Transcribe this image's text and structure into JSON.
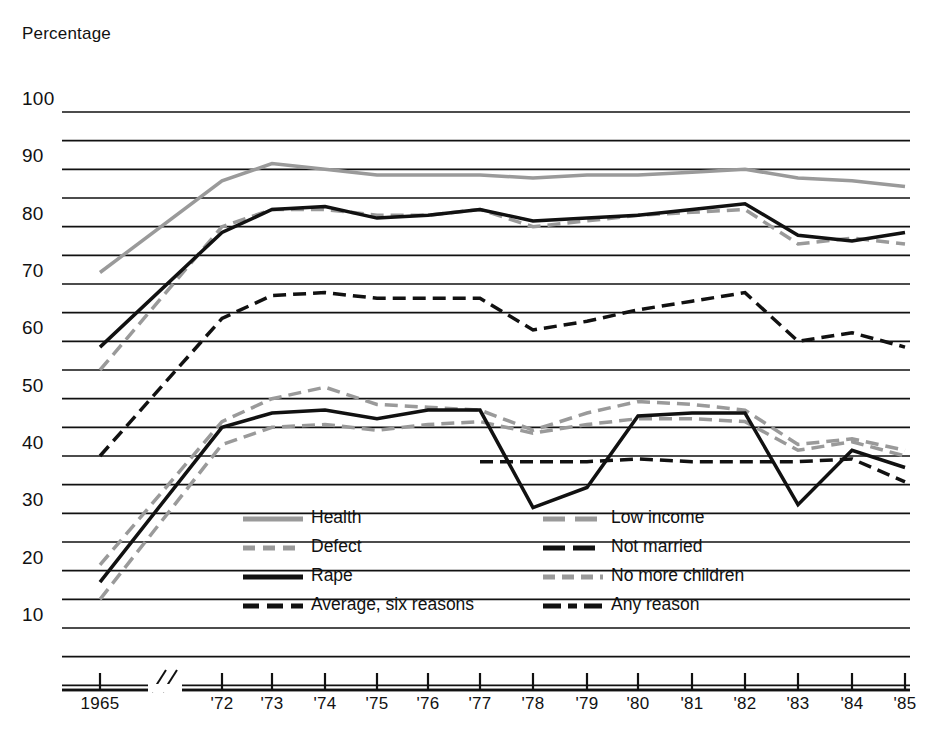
{
  "axes": {
    "y_title": "Percentage",
    "y_ticks": [
      100,
      90,
      80,
      70,
      60,
      50,
      40,
      30,
      20,
      10
    ],
    "x_ticks": [
      "1965",
      "'72",
      "'73",
      "'74",
      "'75",
      "'76",
      "'77",
      "'78",
      "'79",
      "'80",
      "'81",
      "'82",
      "'83",
      "'84",
      "'85"
    ],
    "axis_break_marker": "//"
  },
  "legend": {
    "left": [
      {
        "key": "health",
        "label": "Health"
      },
      {
        "key": "defect",
        "label": "Defect"
      },
      {
        "key": "rape",
        "label": "Rape"
      },
      {
        "key": "average",
        "label": "Average, six reasons"
      }
    ],
    "right": [
      {
        "key": "low_income",
        "label": "Low income"
      },
      {
        "key": "not_married",
        "label": "Not married"
      },
      {
        "key": "no_more_children",
        "label": "No more children"
      },
      {
        "key": "any_reason",
        "label": "Any reason"
      }
    ]
  },
  "chart_data": {
    "type": "line",
    "title": "",
    "xlabel": "",
    "ylabel": "Percentage",
    "ylim": [
      0,
      100
    ],
    "grid": true,
    "legend_position": "inside-bottom-center",
    "x": [
      "1965",
      "'72",
      "'73",
      "'74",
      "'75",
      "'76",
      "'77",
      "'78",
      "'79",
      "'80",
      "'81",
      "'82",
      "'83",
      "'84",
      "'85"
    ],
    "series": [
      {
        "name": "Health",
        "color": "#9a9a9a",
        "style": "solid",
        "width": 3.5,
        "values": [
          72,
          88,
          91,
          90,
          89,
          89,
          89,
          88.5,
          89,
          89,
          89.5,
          90,
          88.5,
          88,
          87
        ]
      },
      {
        "name": "Defect",
        "color": "#9a9a9a",
        "style": "dashed",
        "width": 3.5,
        "values": [
          55,
          80,
          83,
          83,
          82,
          82,
          83,
          80,
          81,
          82,
          82.5,
          83,
          77,
          78,
          77
        ]
      },
      {
        "name": "Rape",
        "color": "#111111",
        "style": "solid",
        "width": 3.5,
        "values": [
          59,
          79,
          83,
          83.5,
          81.5,
          82,
          83,
          81,
          81.5,
          82,
          83,
          84,
          78.5,
          77.5,
          79
        ]
      },
      {
        "name": "Average, six reasons",
        "color": "#111111",
        "style": "dashed",
        "width": 3.5,
        "values": [
          40,
          64,
          68,
          68.5,
          67.5,
          67.5,
          67.5,
          62,
          63.5,
          65.5,
          67,
          68.5,
          60,
          61.5,
          59
        ]
      },
      {
        "name": "Low income",
        "color": "#9a9a9a",
        "style": "dashed",
        "width": 3.5,
        "values": [
          21,
          46,
          50,
          52,
          49,
          48.5,
          48,
          44.5,
          47.5,
          49.5,
          49,
          48,
          42,
          43,
          41
        ]
      },
      {
        "name": "Not married",
        "color": "#111111",
        "style": "dashed",
        "width": 3.5,
        "values": [
          null,
          null,
          null,
          null,
          null,
          null,
          39,
          39,
          39,
          39.5,
          39,
          39,
          39,
          39.5,
          35.5
        ]
      },
      {
        "name": "No more children",
        "color": "#9a9a9a",
        "style": "dashed",
        "width": 3.5,
        "values": [
          15,
          42,
          45,
          45.5,
          44.5,
          45.5,
          46,
          44,
          45.5,
          46.5,
          46.5,
          46,
          41,
          42.5,
          40
        ]
      },
      {
        "name": "Any reason",
        "color": "#111111",
        "style": "solid",
        "width": 3.5,
        "values": [
          18,
          45,
          47.5,
          48,
          46.5,
          48,
          48,
          31,
          34.5,
          47,
          47.5,
          47.5,
          31.5,
          41,
          38
        ]
      }
    ]
  }
}
